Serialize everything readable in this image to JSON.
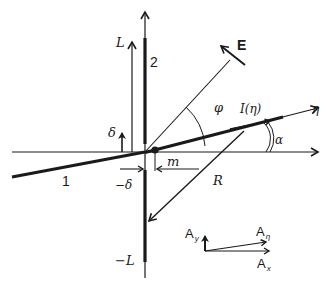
{
  "diagram": {
    "labels": {
      "E": "E",
      "L": "L",
      "minus_L": "−L",
      "delta": "δ",
      "minus_delta": "−δ",
      "two": "2",
      "one": "1",
      "phi": "φ",
      "I_eta": "I(η)",
      "eta": "η",
      "alpha": "α",
      "m": "m",
      "R": "R",
      "A": "A",
      "A_y_sub": "y",
      "A_eta_sub": "η",
      "A_x_sub": "x"
    },
    "colors": {
      "ink": "#1a1a1a",
      "background": "#ffffff"
    }
  }
}
